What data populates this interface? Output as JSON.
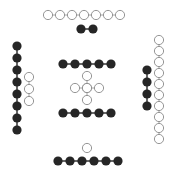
{
  "diagram": {
    "width": 176,
    "height": 176,
    "background": "#ffffff",
    "style": {
      "radius": 4.6,
      "filled_color": "#262626",
      "open_stroke": "#8a8a8a",
      "open_fill": "#ffffff",
      "link_color": "#9a9a9a",
      "open_stroke_width": 0.9
    },
    "groups": [
      {
        "name": "top-open-row",
        "kind": "open",
        "linked": true,
        "points": [
          [
            48,
            15
          ],
          [
            60,
            15
          ],
          [
            72,
            15
          ],
          [
            84,
            15
          ],
          [
            96,
            15
          ],
          [
            108,
            15
          ],
          [
            120,
            15
          ]
        ]
      },
      {
        "name": "top-filled-pair",
        "kind": "filled",
        "linked": true,
        "points": [
          [
            81,
            29
          ],
          [
            93,
            29
          ]
        ]
      },
      {
        "name": "left-filled-column",
        "kind": "filled",
        "linked": true,
        "points": [
          [
            17,
            46
          ],
          [
            17,
            58
          ],
          [
            17,
            70
          ],
          [
            17,
            82
          ],
          [
            17,
            94
          ],
          [
            17,
            106
          ],
          [
            17,
            118
          ],
          [
            17,
            130
          ]
        ]
      },
      {
        "name": "left-open-column",
        "kind": "open",
        "linked": true,
        "points": [
          [
            29,
            77
          ],
          [
            29,
            89
          ],
          [
            29,
            101
          ]
        ]
      },
      {
        "name": "center-top-filled-row",
        "kind": "filled",
        "linked": true,
        "points": [
          [
            63,
            64
          ],
          [
            75,
            64
          ],
          [
            87,
            64
          ],
          [
            99,
            64
          ],
          [
            111,
            64
          ]
        ]
      },
      {
        "name": "center-open-cross-vertical",
        "kind": "open",
        "linked": true,
        "points": [
          [
            87,
            76
          ],
          [
            87,
            88
          ],
          [
            87,
            100
          ]
        ]
      },
      {
        "name": "center-open-cross-horizontal",
        "kind": "open",
        "linked": true,
        "points": [
          [
            75,
            88
          ],
          [
            87,
            88
          ],
          [
            99,
            88
          ]
        ]
      },
      {
        "name": "center-bottom-filled-row",
        "kind": "filled",
        "linked": true,
        "points": [
          [
            63,
            113
          ],
          [
            75,
            113
          ],
          [
            87,
            113
          ],
          [
            99,
            113
          ],
          [
            111,
            113
          ]
        ]
      },
      {
        "name": "right-filled-column",
        "kind": "filled",
        "linked": true,
        "points": [
          [
            147,
            70
          ],
          [
            147,
            82
          ],
          [
            147,
            94
          ],
          [
            147,
            106
          ]
        ]
      },
      {
        "name": "right-open-column",
        "kind": "open",
        "linked": true,
        "points": [
          [
            159,
            40
          ],
          [
            159,
            51
          ],
          [
            159,
            62
          ],
          [
            159,
            73
          ],
          [
            159,
            84
          ],
          [
            159,
            95
          ],
          [
            159,
            106
          ],
          [
            159,
            117
          ],
          [
            159,
            128
          ],
          [
            159,
            139
          ]
        ]
      },
      {
        "name": "bottom-open-single",
        "kind": "open",
        "linked": false,
        "points": [
          [
            87,
            148
          ]
        ]
      },
      {
        "name": "bottom-filled-row",
        "kind": "filled",
        "linked": true,
        "points": [
          [
            58,
            161
          ],
          [
            70,
            161
          ],
          [
            82,
            161
          ],
          [
            94,
            161
          ],
          [
            106,
            161
          ],
          [
            118,
            161
          ]
        ]
      }
    ]
  }
}
